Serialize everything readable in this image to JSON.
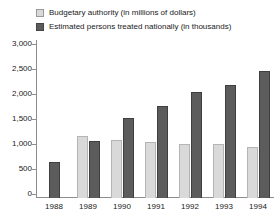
{
  "chart_data": {
    "type": "bar",
    "title": "",
    "xlabel": "",
    "ylabel": "",
    "ylim": [
      0,
      3000
    ],
    "ytick_labels": [
      "3,000",
      "2,500",
      "2,000",
      "1,500",
      "1,000",
      "500",
      "0"
    ],
    "ytick_values": [
      3000,
      2500,
      2000,
      1500,
      1000,
      500,
      0
    ],
    "grid": false,
    "legend_position": "top-left",
    "categories": [
      "1988",
      "1989",
      "1990",
      "1991",
      "1992",
      "1993",
      "1994"
    ],
    "series": [
      {
        "name": "Budgetary authority (in millions of dollars)",
        "color": "#d9d9d9",
        "values": [
          0,
          1200,
          1130,
          1100,
          1060,
          1050,
          1000
        ]
      },
      {
        "name": "Estimated persons treated nationally (in thousands)",
        "color": "#5c5c5c",
        "values": [
          700,
          1120,
          1560,
          1800,
          2060,
          2200,
          2480
        ]
      }
    ]
  },
  "legend": {
    "items": [
      {
        "label": "Budgetary authority (in millions of dollars)",
        "swatch": "light"
      },
      {
        "label": "Estimated persons treated nationally (in thousands)",
        "swatch": "dark"
      }
    ]
  }
}
